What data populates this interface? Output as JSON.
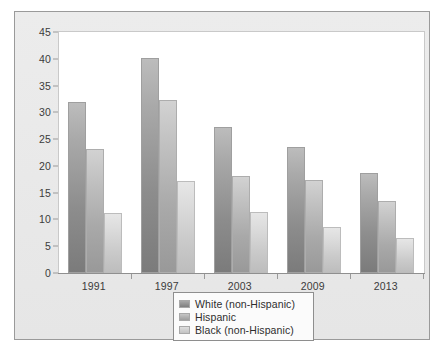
{
  "chart_data": {
    "type": "bar",
    "title": "",
    "subtitle": "",
    "xlabel": "",
    "ylabel": "",
    "categories": [
      "1991",
      "1997",
      "2003",
      "2009",
      "2013"
    ],
    "series": [
      {
        "name": "White (non-Hispanic)",
        "values": [
          32.0,
          40.2,
          27.2,
          23.6,
          18.6
        ],
        "color": "#8d8d8d"
      },
      {
        "name": "Hispanic",
        "values": [
          23.1,
          32.3,
          18.2,
          17.3,
          13.5
        ],
        "color": "#aeaeae"
      },
      {
        "name": "Black (non-Hispanic)",
        "values": [
          11.2,
          17.2,
          11.3,
          8.5,
          6.6
        ],
        "color": "#d0d0d0"
      }
    ],
    "ylim": [
      0,
      45
    ],
    "yticks": [
      0,
      5,
      10,
      15,
      20,
      25,
      30,
      35,
      40,
      45
    ],
    "ytick_labels": [
      "0",
      "5",
      "10",
      "15",
      "20",
      "25",
      "30",
      "35",
      "40",
      "45"
    ],
    "grid": false,
    "legend_position": "bottom-center"
  },
  "legend": {
    "items": [
      {
        "label": "White (non-Hispanic)"
      },
      {
        "label": "Hispanic"
      },
      {
        "label": "Black (non-Hispanic)"
      }
    ]
  },
  "colors": {
    "panel_background": "#e9e9e9",
    "panel_border": "#9a9a9a",
    "plot_background": "#ffffff",
    "plot_border": "#c9c9c9",
    "axis_line": "#8f8f8f",
    "tick_text": "#3b3b3b",
    "legend_background": "#fbfbfb",
    "legend_border": "#8e8e8e"
  }
}
